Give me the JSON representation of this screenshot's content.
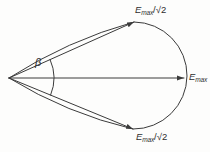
{
  "figure": {
    "background_color": "#fdfdfc",
    "line_color": "#3b3b3b",
    "beta_label": "β",
    "labels": {
      "top": {
        "symbol": "E",
        "subscript": "max",
        "suffix": "/√2"
      },
      "right": {
        "symbol": "E",
        "subscript": "max",
        "suffix": ""
      },
      "bottom": {
        "symbol": "E",
        "subscript": "max",
        "suffix": "/√2"
      }
    }
  }
}
